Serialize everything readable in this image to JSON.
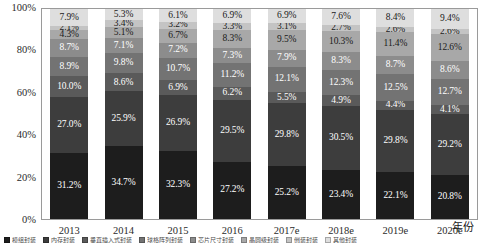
{
  "chart_data": {
    "type": "bar",
    "stacked": true,
    "normalized_percent": true,
    "title": "",
    "subtitle": "",
    "xlabel": "年份",
    "ylabel": "",
    "ylim": [
      0,
      100
    ],
    "grid": false,
    "legend_position": "bottom",
    "y_ticks": [
      "0%",
      "20%",
      "40%",
      "60%",
      "80%",
      "100%"
    ],
    "y_tick_values": [
      0,
      20,
      40,
      60,
      80,
      100
    ],
    "categories": [
      "2013",
      "2014",
      "2015",
      "2016",
      "2017e",
      "2018e",
      "2019e",
      "2020e"
    ],
    "series": [
      {
        "name": "模组封装",
        "color": "#1d1d1d",
        "values": [
          31.2,
          34.7,
          32.3,
          27.2,
          25.2,
          23.4,
          22.1,
          20.8
        ],
        "labels": [
          "31.2%",
          "34.7%",
          "32.3%",
          "27.2%",
          "25.2%",
          "23.4%",
          "22.1%",
          "20.8%"
        ]
      },
      {
        "name": "内存封装",
        "color": "#3d3d3d",
        "values": [
          27.0,
          25.9,
          26.9,
          29.5,
          29.8,
          30.5,
          29.8,
          29.2
        ],
        "labels": [
          "27.0%",
          "25.9%",
          "26.9%",
          "29.5%",
          "29.8%",
          "30.5%",
          "29.8%",
          "29.2%"
        ]
      },
      {
        "name": "垂直插入式封装",
        "color": "#5a5a5a",
        "values": [
          10.0,
          8.6,
          6.9,
          6.2,
          5.5,
          4.9,
          4.4,
          4.1
        ],
        "labels": [
          "10.0%",
          "8.6%",
          "6.9%",
          "6.2%",
          "5.5%",
          "4.9%",
          "4.4%",
          "4.1%"
        ]
      },
      {
        "name": "球格阵列封装",
        "color": "#737373",
        "values": [
          8.9,
          9.8,
          10.7,
          11.2,
          12.1,
          12.3,
          12.5,
          12.7
        ],
        "labels": [
          "8.9%",
          "9.8%",
          "10.7%",
          "11.2%",
          "12.1%",
          "12.3%",
          "12.5%",
          "12.7%"
        ]
      },
      {
        "name": "芯片尺寸封装",
        "color": "#8c8c8c",
        "values": [
          8.7,
          7.1,
          7.2,
          7.3,
          7.9,
          8.3,
          8.7,
          8.6
        ],
        "labels": [
          "8.7%",
          "7.1%",
          "7.2%",
          "7.3%",
          "7.9%",
          "8.3%",
          "8.7%",
          "8.6%"
        ]
      },
      {
        "name": "晶圆级封装",
        "color": "#a8a8a8",
        "values": [
          4.2,
          5.1,
          6.7,
          8.3,
          9.5,
          10.3,
          11.4,
          12.6
        ],
        "labels": [
          "4.3%",
          "5.1%",
          "6.7%",
          "8.3%",
          "9.5%",
          "10.3%",
          "11.4%",
          "12.6%"
        ]
      },
      {
        "name": "倒装封装",
        "color": "#c4c4c4",
        "values": [
          2.1,
          3.4,
          3.2,
          3.3,
          3.1,
          2.7,
          2.6,
          2.6
        ],
        "labels": [
          "2.1%",
          "3.4%",
          "3.2%",
          "3.3%",
          "3.1%",
          "2.7%",
          "2.6%",
          "2.6%"
        ]
      },
      {
        "name": "其他封装",
        "color": "#dedede",
        "values": [
          7.9,
          5.3,
          6.1,
          6.9,
          6.9,
          7.6,
          8.4,
          9.4
        ],
        "labels": [
          "7.9%",
          "5.3%",
          "6.1%",
          "6.9%",
          "6.9%",
          "7.6%",
          "8.4%",
          "9.4%"
        ]
      }
    ]
  }
}
